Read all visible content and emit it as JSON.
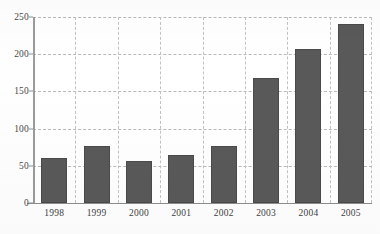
{
  "chart_data": {
    "type": "bar",
    "title": "",
    "subtitle": "",
    "xlabel": "",
    "ylabel": "",
    "categories": [
      "1998",
      "1999",
      "2000",
      "2001",
      "2002",
      "2003",
      "2004",
      "2005"
    ],
    "values": [
      60,
      76,
      57,
      64,
      77,
      168,
      207,
      240
    ],
    "series": [
      {
        "name": "",
        "values": [
          60,
          76,
          57,
          64,
          77,
          168,
          207,
          240
        ]
      }
    ],
    "ylim": [
      0,
      250
    ],
    "ytick_labels": [
      "0",
      "50",
      "100",
      "150",
      "200",
      "250"
    ],
    "ytick_values": [
      0,
      50,
      100,
      150,
      200,
      250
    ],
    "xtick_labels": [
      "1998",
      "1999",
      "2000",
      "2001",
      "2002",
      "2003",
      "2004",
      "2005"
    ],
    "grid": {
      "horizontal": true,
      "vertical": true,
      "style": "dashed"
    },
    "legend": {
      "visible": false,
      "position": "none",
      "entries": []
    },
    "annotations": [],
    "colors": {
      "bar_fill": "#595959",
      "bar_border": "#4a4a4a",
      "gridline": "#c2c2c2",
      "axis": "#8e8e8e",
      "background": "#ffffff",
      "tick_label": "#3f3f3f"
    }
  }
}
